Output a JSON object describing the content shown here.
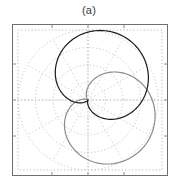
{
  "figure": {
    "caption": "(a)",
    "background_color": "#ffffff"
  },
  "plot": {
    "frame_color": "#6e6e6e",
    "grid_color": "#bdbdbd",
    "dotted_rect_color": "#b9b9b9",
    "tick_color": "#8a8a8a",
    "origin_x": 88,
    "origin_y": 100
  },
  "chart_data": {
    "type": "line",
    "subtype": "polar",
    "title": "(a)",
    "xlabel": "",
    "ylabel": "",
    "grid": true,
    "grid_style": "dotted concentric circles with radial spokes",
    "legend_position": "none",
    "polar": {
      "center_px": [
        76,
        76
      ],
      "radial_rings": [
        0.25,
        0.5,
        0.75,
        1.0
      ],
      "radial_max": 1.0,
      "angular_spokes_deg": [
        0,
        30,
        60,
        90,
        120,
        150,
        180,
        210,
        240,
        270,
        300,
        330
      ],
      "theta_zero_location": "E",
      "theta_direction": "counterclockwise"
    },
    "axis_ranges": {
      "x": [
        -1.0,
        1.0
      ],
      "y": [
        -1.0,
        1.0
      ]
    },
    "series": [
      {
        "name": "cardioid-upper",
        "color": "#1a1a1a",
        "linewidth": 1.2,
        "equation": "r = a*(1 + cos(theta)) rotated +60 deg",
        "rotation_deg": 60,
        "scale": 0.52,
        "values_theta_deg": [
          0,
          15,
          30,
          45,
          60,
          75,
          90,
          105,
          120,
          135,
          150,
          165,
          180,
          195,
          210,
          225,
          240,
          255,
          270,
          285,
          300,
          315,
          330,
          345,
          360
        ],
        "values_r": [
          1.0,
          0.966,
          0.866,
          0.707,
          0.5,
          0.259,
          0.0,
          0.259,
          0.5,
          0.707,
          0.866,
          0.966,
          1.0,
          1.707,
          1.866,
          1.707,
          1.5,
          1.259,
          1.0,
          0.741,
          0.5,
          0.293,
          0.134,
          0.034,
          1.0
        ]
      },
      {
        "name": "cardioid-lower",
        "color": "#8c8c8c",
        "linewidth": 1.2,
        "equation": "r = a*(1 + cos(theta)) rotated -40 deg",
        "rotation_deg": -40,
        "scale": 0.52,
        "values_theta_deg": [
          0,
          15,
          30,
          45,
          60,
          75,
          90,
          105,
          120,
          135,
          150,
          165,
          180,
          195,
          210,
          225,
          240,
          255,
          270,
          285,
          300,
          315,
          330,
          345,
          360
        ],
        "values_r": [
          1.0,
          0.966,
          0.866,
          0.707,
          0.5,
          0.259,
          0.0,
          0.259,
          0.5,
          0.707,
          0.866,
          0.966,
          1.0,
          1.707,
          1.866,
          1.707,
          1.5,
          1.259,
          1.0,
          0.741,
          0.5,
          0.293,
          0.134,
          0.034,
          1.0
        ]
      }
    ]
  }
}
